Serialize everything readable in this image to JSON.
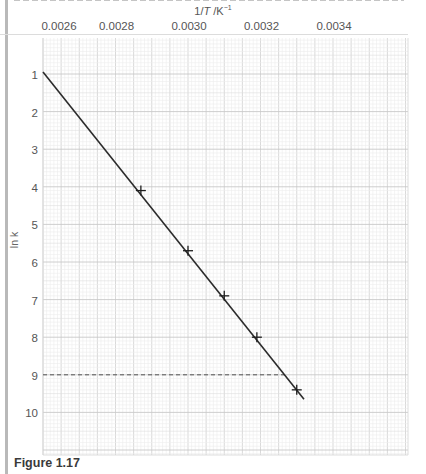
{
  "figure": {
    "caption": "Figure 1.17"
  },
  "chart_data": {
    "type": "line",
    "title": "",
    "xlabel_prefix": "1/",
    "xlabel_var": "T",
    "xlabel_unit": " /K",
    "xlabel_exp": "−1",
    "xlabel": "1/T /K^-1",
    "ylabel": "ln k",
    "x_ticks": [
      "0.0026",
      "0.0028",
      "0.0030",
      "0.0032",
      "0.0034"
    ],
    "y_ticks": [
      "1",
      "2",
      "3",
      "4",
      "5",
      "6",
      "7",
      "8",
      "9",
      "10"
    ],
    "xlim": [
      0.0026,
      0.0035
    ],
    "ylim": [
      11.1,
      0.0
    ],
    "y_inverted": true,
    "x_axis_position": "top",
    "grid": true,
    "series": [
      {
        "name": "ln k vs 1/T (data points)",
        "marker": "+",
        "x": [
          0.00287,
          0.003,
          0.0031,
          0.00319,
          0.0033
        ],
        "y": [
          4.1,
          5.7,
          6.9,
          8.0,
          9.4
        ]
      },
      {
        "name": "best-fit line",
        "x": [
          0.0026,
          0.00332
        ],
        "y": [
          0.95,
          9.65
        ]
      }
    ],
    "annotations": [
      {
        "type": "dashed-hline",
        "y": 9.0,
        "x_from": 0.0026,
        "x_to": 0.003275
      }
    ]
  }
}
